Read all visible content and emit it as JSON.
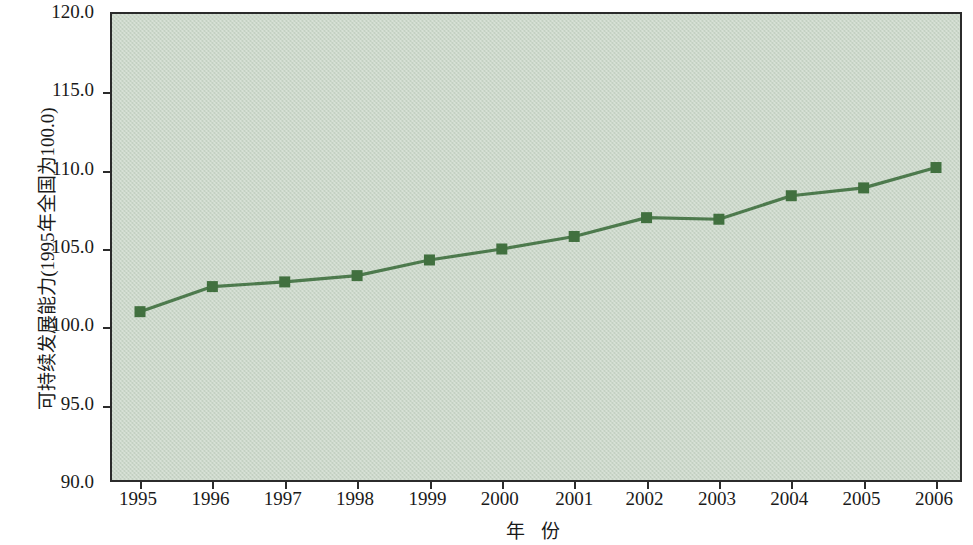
{
  "chart_data": {
    "type": "line",
    "title": "",
    "subtitle": "",
    "xlabel": "年  份",
    "ylabel": "可持续发展能力(1995年全国为100.0)",
    "categories": [
      "1995",
      "1996",
      "1997",
      "1998",
      "1999",
      "2000",
      "2001",
      "2002",
      "2003",
      "2004",
      "2005",
      "2006"
    ],
    "values": [
      101.0,
      102.6,
      102.9,
      103.3,
      104.3,
      105.0,
      105.8,
      107.0,
      106.9,
      108.4,
      108.9,
      110.2
    ],
    "series": [
      {
        "name": "可持续发展能力",
        "values": [
          101.0,
          102.6,
          102.9,
          103.3,
          104.3,
          105.0,
          105.8,
          107.0,
          106.9,
          108.4,
          108.9,
          110.2
        ]
      }
    ],
    "ylim": [
      90.0,
      120.0
    ],
    "ytick_values": [
      90.0,
      95.0,
      100.0,
      105.0,
      110.0,
      115.0,
      120.0
    ],
    "ytick_labels": [
      "90.0",
      "95.0",
      "100.0",
      "105.0",
      "110.0",
      "115.0",
      "120.0"
    ],
    "xtick_labels": [
      "1995",
      "1996",
      "1997",
      "1998",
      "1999",
      "2000",
      "2001",
      "2002",
      "2003",
      "2004",
      "2005",
      "2006"
    ],
    "grid": false,
    "legend": "none",
    "marker": "square",
    "colors": {
      "line": "#4d7a4d",
      "marker": "#41703f",
      "plot_background": "#ccd8ca",
      "axis": "#2b2b2b",
      "text": "#1a1a1a",
      "page_background": "#ffffff"
    }
  }
}
